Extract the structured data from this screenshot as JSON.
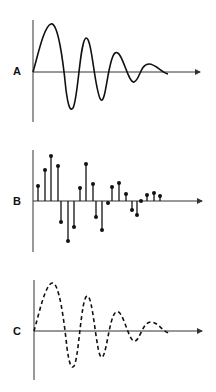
{
  "panels": [
    {
      "label": "A",
      "style": "continuous damped oscillation",
      "axis_y": 72
    },
    {
      "label": "B",
      "style": "discrete sampled stems",
      "axis_y": 201
    },
    {
      "label": "C",
      "style": "dashed reconstructed oscillation",
      "axis_y": 331
    }
  ],
  "colors": {
    "line": "#111111",
    "axis": "#333333",
    "background": "#ffffff"
  },
  "stems": [
    {
      "x": 38,
      "y": 186
    },
    {
      "x": 45,
      "y": 170
    },
    {
      "x": 51,
      "y": 156
    },
    {
      "x": 58,
      "y": 166
    },
    {
      "x": 61,
      "y": 222
    },
    {
      "x": 68,
      "y": 241
    },
    {
      "x": 74,
      "y": 227
    },
    {
      "x": 80,
      "y": 188
    },
    {
      "x": 86,
      "y": 164
    },
    {
      "x": 93,
      "y": 184
    },
    {
      "x": 96,
      "y": 217
    },
    {
      "x": 102,
      "y": 230
    },
    {
      "x": 108,
      "y": 203
    },
    {
      "x": 112,
      "y": 187
    },
    {
      "x": 119,
      "y": 183
    },
    {
      "x": 126,
      "y": 194
    },
    {
      "x": 132,
      "y": 210
    },
    {
      "x": 137,
      "y": 215
    },
    {
      "x": 141,
      "y": 201
    },
    {
      "x": 147,
      "y": 195
    },
    {
      "x": 154,
      "y": 193
    },
    {
      "x": 160,
      "y": 196
    }
  ]
}
